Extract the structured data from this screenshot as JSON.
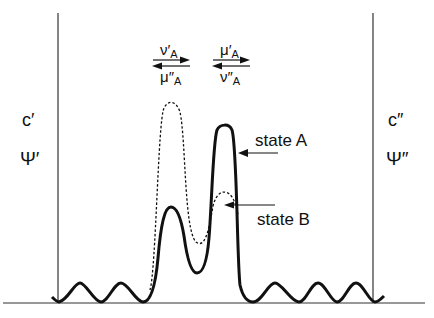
{
  "diagram": {
    "colors": {
      "ink": "#111111",
      "thin": "#222222",
      "background": "#ffffff"
    },
    "left_boundary": {
      "top_label": "c′",
      "bottom_label": "Ψ′"
    },
    "right_boundary": {
      "top_label": "c″",
      "bottom_label": "Ψ″"
    },
    "flux_left": {
      "upper": "ν′",
      "upper_sub": "A",
      "lower": "μ″",
      "lower_sub": "A"
    },
    "flux_right": {
      "upper": "μ′",
      "upper_sub": "A",
      "lower": "ν″",
      "lower_sub": "A"
    },
    "curves": [
      {
        "name": "state A",
        "style": "solid",
        "label": "state A"
      },
      {
        "name": "state B",
        "style": "dashed",
        "label": "state B"
      }
    ]
  }
}
